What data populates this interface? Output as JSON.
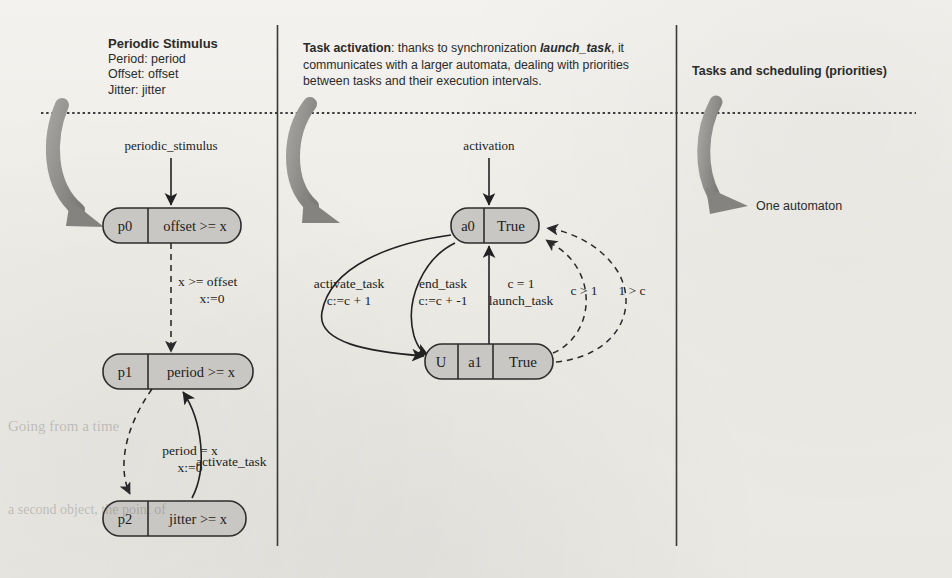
{
  "panels": {
    "left": {
      "title": "Periodic Stimulus",
      "lines": [
        "Period: period",
        "Offset: offset",
        "Jitter: jitter"
      ]
    },
    "middle": {
      "title": "Task activation",
      "body_1": ": thanks to synchronization ",
      "sync_name": "launch_task",
      "body_2": ", it communicates with a larger automata, dealing with priorities between tasks and their execution intervals."
    },
    "right": {
      "title": "Tasks and scheduling (priorities)",
      "annotation": "One automaton"
    }
  },
  "left_automaton": {
    "input_label": "periodic_stimulus",
    "nodes": [
      {
        "id": "p0",
        "name": "p0",
        "invariant": "offset >= x"
      },
      {
        "id": "p1",
        "name": "p1",
        "invariant": "period >= x"
      },
      {
        "id": "p2",
        "name": "p2",
        "invariant": "jitter >= x"
      }
    ],
    "transitions": [
      {
        "from": "p0",
        "to": "p1",
        "style": "dashed",
        "guard": "x >= offset",
        "update": "x:=0"
      },
      {
        "from": "p1",
        "to": "p2",
        "style": "dashed",
        "guard": "period = x",
        "update": "x:=0"
      },
      {
        "from": "p2",
        "to": "p1",
        "style": "solid",
        "guard": "activate_task",
        "update": ""
      }
    ]
  },
  "middle_automaton": {
    "input_label": "activation",
    "nodes": [
      {
        "id": "a0",
        "urgent": "",
        "name": "a0",
        "invariant": "True"
      },
      {
        "id": "a1",
        "urgent": "U",
        "name": "a1",
        "invariant": "True"
      }
    ],
    "transitions": [
      {
        "from": "a0",
        "to": "a1",
        "style": "solid",
        "guard": "activate_task",
        "update": "c:=c + 1"
      },
      {
        "from": "a1",
        "to": "a0",
        "style": "solid",
        "guard": "end_task",
        "update": "c:=c + -1"
      },
      {
        "from": "a1",
        "to": "a0",
        "style": "solid",
        "guard": "c = 1",
        "update": "launch_task"
      },
      {
        "from": "a1",
        "to": "a0",
        "style": "dashed",
        "guard": "c > 1",
        "update": ""
      },
      {
        "from": "a1",
        "to": "a0",
        "style": "dashed",
        "guard": "1 > c",
        "update": ""
      }
    ]
  },
  "ghost_text": {
    "line_a": "Going from a time",
    "line_b": "a second object, the point of",
    "line_c": "keeping the wait time"
  },
  "colors": {
    "node_fill": "#c9c7c3",
    "node_stroke": "#2d2d2d",
    "accent_gray_arrow": "#8f8d89",
    "divider": "#3a3a3a",
    "text": "#2b2b2b"
  }
}
